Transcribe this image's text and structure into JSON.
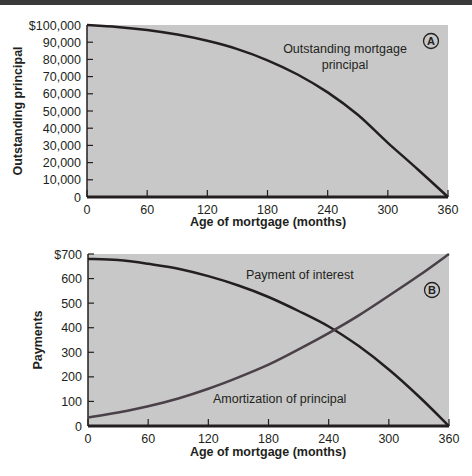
{
  "chart_data": [
    {
      "id": "A",
      "type": "line",
      "badge": "A",
      "title": "",
      "xlabel": "Age of mortgage (months)",
      "ylabel": "Outstanding principal",
      "xlim": [
        0,
        360
      ],
      "ylim": [
        0,
        100000
      ],
      "x_ticks": [
        "0",
        "60",
        "120",
        "180",
        "240",
        "300",
        "360"
      ],
      "y_ticks": [
        "0",
        "10,000",
        "20,000",
        "30,000",
        "40,000",
        "50,000",
        "60,000",
        "70,000",
        "80,000",
        "90,000",
        "$100,000"
      ],
      "grid": false,
      "background": "#c8c8c8",
      "series": [
        {
          "name": "Outstanding mortgage principal",
          "label_lines": [
            "Outstanding mortgage",
            "principal"
          ],
          "color": "#231f20",
          "x": [
            0,
            30,
            60,
            90,
            120,
            150,
            180,
            210,
            240,
            270,
            300,
            330,
            360
          ],
          "values": [
            100000,
            98900,
            97100,
            94400,
            90800,
            86000,
            79500,
            71200,
            60800,
            47800,
            31500,
            16000,
            0
          ]
        }
      ]
    },
    {
      "id": "B",
      "type": "line",
      "badge": "B",
      "title": "",
      "xlabel": "Age of mortgage (months)",
      "ylabel": "Payments",
      "xlim": [
        0,
        360
      ],
      "ylim": [
        0,
        700
      ],
      "x_ticks": [
        "0",
        "60",
        "120",
        "180",
        "240",
        "300",
        "360"
      ],
      "y_ticks": [
        "0",
        "100",
        "200",
        "300",
        "400",
        "500",
        "600",
        "$700"
      ],
      "grid": false,
      "background": "#c8c8c8",
      "series": [
        {
          "name": "Payment of interest",
          "color": "#231f20",
          "x": [
            0,
            30,
            60,
            90,
            120,
            150,
            180,
            210,
            240,
            270,
            300,
            330,
            360
          ],
          "values": [
            680,
            675,
            660,
            640,
            610,
            572,
            525,
            468,
            405,
            325,
            230,
            120,
            0
          ]
        },
        {
          "name": "Amortization of principal",
          "color": "#4a4048",
          "x": [
            0,
            30,
            60,
            90,
            120,
            150,
            180,
            210,
            240,
            270,
            300,
            330,
            360
          ],
          "values": [
            35,
            55,
            80,
            112,
            152,
            198,
            250,
            312,
            378,
            450,
            530,
            612,
            700
          ]
        }
      ]
    }
  ],
  "annotations": {
    "top_label_line1": "Outstanding mortgage",
    "top_label_line2": "principal",
    "interest_label": "Payment of interest",
    "principal_label": "Amortization of principal",
    "badge_a": "A",
    "badge_b": "B"
  }
}
